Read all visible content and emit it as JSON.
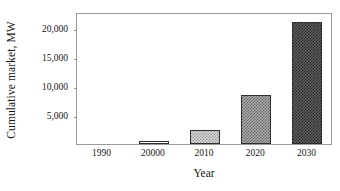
{
  "chart_data": {
    "type": "bar",
    "title": "",
    "xlabel": "Year",
    "ylabel": "Cumulative market, MW",
    "categories": [
      "1990",
      "20000",
      "2010",
      "2020",
      "2030"
    ],
    "values": [
      0,
      600,
      2400,
      8500,
      21000
    ],
    "ylim": [
      0,
      22700
    ],
    "yticks": [
      5000,
      10000,
      15000,
      20000
    ],
    "ytick_labels": [
      "5,000",
      "10,000",
      "15,000",
      "20,000"
    ],
    "grid": false,
    "legend": null,
    "bar_fills": [
      "none",
      "white",
      "light-gray-stipple",
      "medium-gray-stipple",
      "dark-gray-stipple"
    ],
    "bar_colors": [
      "#ffffff",
      "#ffffff",
      "#d4d4d4",
      "#a9a9a9",
      "#5d5d5d"
    ],
    "bar_border_color": "#2e2e2e",
    "frame_color": "#9a9a9a",
    "background": "#ffffff"
  },
  "axes": {
    "y_title": "Cumulative market, MW",
    "x_title": "Year"
  }
}
